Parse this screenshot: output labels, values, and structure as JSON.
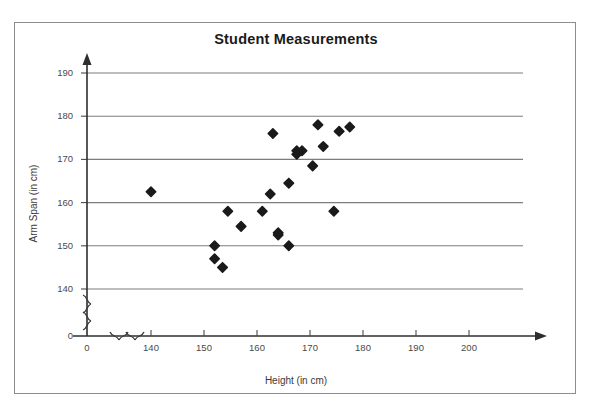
{
  "page": {
    "cutoff_text_above": "",
    "border_color": "#8d8d8d",
    "background": "#ffffff"
  },
  "figure": {
    "title": "Student Measurements"
  },
  "chart_data": {
    "type": "scatter",
    "title": "Student Measurements",
    "xlabel": "Height (in cm)",
    "ylabel": "Arm Span (in cm)",
    "xlim": [
      140,
      200
    ],
    "ylim": [
      140,
      190
    ],
    "x_axis_break": true,
    "y_axis_break": true,
    "x_origin_label": "0",
    "y_origin_label": "0",
    "xticks": [
      140,
      150,
      160,
      170,
      180,
      190,
      200
    ],
    "yticks": [
      140,
      150,
      160,
      170,
      180,
      190
    ],
    "xtick_labels": [
      "140",
      "150",
      "160",
      "170",
      "180",
      "190",
      "200"
    ],
    "ytick_labels": [
      "140",
      "150",
      "160",
      "170",
      "180",
      "190"
    ],
    "grid": "horizontal",
    "grid_color": "#7d7d7d",
    "marker": "diamond",
    "marker_color": "#1a1a1a",
    "marker_size": 7,
    "legend": null,
    "n_points": 22,
    "points": [
      {
        "x": 140,
        "y": 162.5
      },
      {
        "x": 152,
        "y": 150.0
      },
      {
        "x": 152,
        "y": 147.0
      },
      {
        "x": 153.5,
        "y": 145.0
      },
      {
        "x": 154.5,
        "y": 158.0
      },
      {
        "x": 157,
        "y": 154.5
      },
      {
        "x": 161,
        "y": 158.0
      },
      {
        "x": 164,
        "y": 152.5
      },
      {
        "x": 164,
        "y": 153.0
      },
      {
        "x": 162.5,
        "y": 162.0
      },
      {
        "x": 166,
        "y": 150.0
      },
      {
        "x": 166,
        "y": 164.5
      },
      {
        "x": 163,
        "y": 176.0
      },
      {
        "x": 167.5,
        "y": 172.0
      },
      {
        "x": 167.5,
        "y": 171.2
      },
      {
        "x": 168.5,
        "y": 172.0
      },
      {
        "x": 170.5,
        "y": 168.5
      },
      {
        "x": 171.5,
        "y": 178.0
      },
      {
        "x": 172.5,
        "y": 173.0
      },
      {
        "x": 174.5,
        "y": 158.0
      },
      {
        "x": 175.5,
        "y": 176.5
      },
      {
        "x": 177.5,
        "y": 177.5
      }
    ]
  }
}
